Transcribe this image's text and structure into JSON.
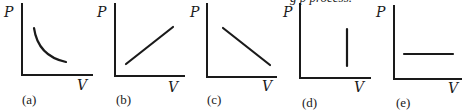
{
  "figure": {
    "top_text_fragment": "g p          process.",
    "graphs": [
      {
        "id": "a",
        "caption": "(a)",
        "y_label": "P",
        "x_label": "V",
        "shape": "hyperbola-decreasing"
      },
      {
        "id": "b",
        "caption": "(b)",
        "y_label": "P",
        "x_label": "V",
        "shape": "line-increasing"
      },
      {
        "id": "c",
        "caption": "(c)",
        "y_label": "P",
        "x_label": "V",
        "shape": "line-decreasing"
      },
      {
        "id": "d",
        "caption": "(d)",
        "y_label": "P",
        "x_label": "V",
        "shape": "vertical-line"
      },
      {
        "id": "e",
        "caption": "(e)",
        "y_label": "P",
        "x_label": "V",
        "shape": "horizontal-line"
      }
    ]
  },
  "colors": {
    "ink": "#1a1a1a",
    "background": "#ffffff"
  }
}
